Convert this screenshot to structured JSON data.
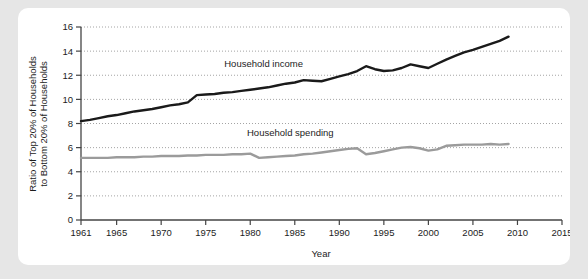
{
  "chart_data": {
    "type": "line",
    "title": "",
    "xlabel": "Year",
    "ylabel": "Ratio of Top 20% of Households to Bottom 20% of Households",
    "ylabel_line1": "Ratio of Top 20% of Households",
    "ylabel_line2": "to Bottom 20% of Households",
    "xlim": [
      1961,
      2015
    ],
    "ylim": [
      0,
      16
    ],
    "yticks": [
      0,
      2,
      4,
      6,
      8,
      10,
      12,
      14,
      16
    ],
    "ytick_labels": [
      "0",
      "2",
      "4",
      "6",
      "8",
      "10",
      "12",
      "14",
      "16"
    ],
    "xticks": [
      1961,
      1965,
      1970,
      1975,
      1980,
      1985,
      1990,
      1995,
      2000,
      2005,
      2010,
      2015
    ],
    "xtick_labels": [
      "1961",
      "1965",
      "1970",
      "1975",
      "1980",
      "1985",
      "1990",
      "1995",
      "2000",
      "2005",
      "2010",
      "2015"
    ],
    "grid": true,
    "grid_axis": "y",
    "legend_position": "inline-annotation",
    "series": [
      {
        "name": "Household income",
        "color": "#1a1a1a",
        "annotation": "Household income",
        "annotation_x": 1981.5,
        "annotation_y": 12.7,
        "x": [
          1961,
          1962,
          1963,
          1964,
          1965,
          1966,
          1967,
          1968,
          1969,
          1970,
          1971,
          1972,
          1973,
          1974,
          1975,
          1976,
          1977,
          1978,
          1979,
          1980,
          1981,
          1982,
          1983,
          1984,
          1985,
          1986,
          1987,
          1988,
          1989,
          1990,
          1991,
          1992,
          1993,
          1994,
          1995,
          1996,
          1997,
          1998,
          1999,
          2000,
          2001,
          2002,
          2003,
          2004,
          2005,
          2006,
          2007,
          2008,
          2009
        ],
        "values": [
          8.2,
          8.3,
          8.45,
          8.6,
          8.7,
          8.85,
          9.0,
          9.1,
          9.2,
          9.35,
          9.5,
          9.6,
          9.75,
          10.35,
          10.4,
          10.45,
          10.55,
          10.6,
          10.7,
          10.8,
          10.9,
          11.0,
          11.15,
          11.3,
          11.4,
          11.6,
          11.55,
          11.5,
          11.7,
          11.9,
          12.1,
          12.35,
          12.75,
          12.5,
          12.35,
          12.4,
          12.6,
          12.9,
          12.75,
          12.6,
          12.95,
          13.3,
          13.6,
          13.9,
          14.1,
          14.35,
          14.6,
          14.85,
          15.2
        ]
      },
      {
        "name": "Household spending",
        "color": "#9b9b9b",
        "annotation": "Household spending",
        "annotation_x": 1984.5,
        "annotation_y": 6.95,
        "x": [
          1961,
          1962,
          1963,
          1964,
          1965,
          1966,
          1967,
          1968,
          1969,
          1970,
          1971,
          1972,
          1973,
          1974,
          1975,
          1976,
          1977,
          1978,
          1979,
          1980,
          1981,
          1982,
          1983,
          1984,
          1985,
          1986,
          1987,
          1988,
          1989,
          1990,
          1991,
          1992,
          1993,
          1994,
          1995,
          1996,
          1997,
          1998,
          1999,
          2000,
          2001,
          2002,
          2003,
          2004,
          2005,
          2006,
          2007,
          2008,
          2009
        ],
        "values": [
          5.15,
          5.15,
          5.15,
          5.15,
          5.2,
          5.2,
          5.2,
          5.25,
          5.25,
          5.3,
          5.3,
          5.3,
          5.35,
          5.35,
          5.4,
          5.4,
          5.4,
          5.45,
          5.45,
          5.5,
          5.15,
          5.2,
          5.25,
          5.3,
          5.35,
          5.45,
          5.5,
          5.6,
          5.7,
          5.8,
          5.9,
          5.95,
          5.45,
          5.55,
          5.7,
          5.85,
          6.0,
          6.05,
          5.95,
          5.75,
          5.85,
          6.15,
          6.2,
          6.25,
          6.25,
          6.25,
          6.3,
          6.25,
          6.3
        ]
      }
    ]
  }
}
